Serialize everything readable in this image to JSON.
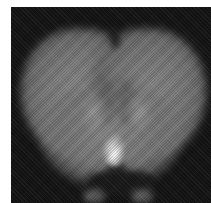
{
  "caption": {
    "text": "•••• • •• ••••",
    "legible": false
  },
  "image": {
    "subject": "coronal brain section scan (grayscale)",
    "palette": {
      "background": "#141414",
      "tissue": "#7b7b7b",
      "highlight": "#ffffff",
      "page": "#ffffff"
    }
  }
}
